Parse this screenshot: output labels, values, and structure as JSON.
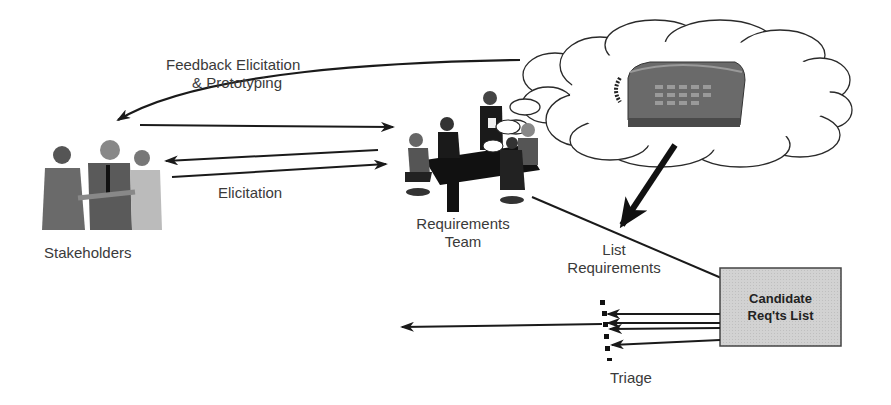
{
  "diagram": {
    "labels": {
      "feedback_line1": "Feedback Elicitation",
      "feedback_line2": "& Prototyping",
      "elicitation": "Elicitation",
      "stakeholders": "Stakeholders",
      "requirements_team_line1": "Requirements",
      "requirements_team_line2": "Team",
      "list_requirements_line1": "List",
      "list_requirements_line2": "Requirements",
      "candidate_line1": "Candidate",
      "candidate_line2": "Req'ts List",
      "triage": "Triage"
    },
    "nodes": [
      {
        "id": "stakeholders",
        "icon": "people-handshake-icon"
      },
      {
        "id": "requirements-team",
        "icon": "meeting-table-icon"
      },
      {
        "id": "idea-cloud",
        "icon": "thought-cloud-telephone-icon"
      },
      {
        "id": "candidate-list",
        "shape": "box"
      },
      {
        "id": "triage",
        "shape": "dotted-filter"
      }
    ],
    "colors": {
      "stroke": "#1a1a1a",
      "text": "#3a3a3a",
      "box_fill": "#d4d4d4",
      "phone_fill": "#6a6a6a",
      "cloud_stroke": "#2a2a2a"
    }
  }
}
